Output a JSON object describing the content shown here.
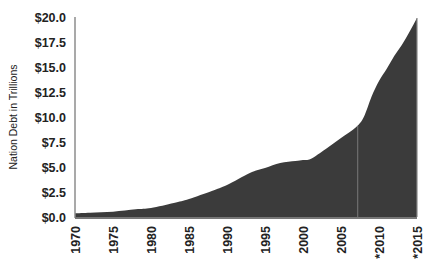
{
  "chart_data": {
    "type": "area",
    "title": "",
    "xlabel": "",
    "ylabel": "Nation Debt in Trillions",
    "x_tick_labels": [
      "1970",
      "1975",
      "1980",
      "1985",
      "1990",
      "1995",
      "2000",
      "2005",
      "*2010",
      "*2015"
    ],
    "y_tick_labels": [
      "$0.0",
      "$2.5",
      "$5.0",
      "$7.5",
      "$10.0",
      "$12.5",
      "$15.0",
      "$17.5",
      "$20.0"
    ],
    "xlim": [
      1970,
      2015
    ],
    "ylim": [
      0,
      20
    ],
    "grid": false,
    "legend": null,
    "fill_color": "#3b3b3b",
    "series": [
      {
        "name": "National Debt (Trillions USD)",
        "x": [
          1970,
          1972,
          1975,
          1978,
          1980,
          1983,
          1985,
          1988,
          1990,
          1993,
          1995,
          1997,
          1999,
          2000,
          2001,
          2003,
          2005,
          2007,
          2008,
          2009,
          2010,
          2011,
          2012,
          2013,
          2014,
          2015
        ],
        "values": [
          0.37,
          0.43,
          0.53,
          0.77,
          0.9,
          1.4,
          1.8,
          2.6,
          3.2,
          4.4,
          4.9,
          5.4,
          5.6,
          5.7,
          5.8,
          6.8,
          7.9,
          9.0,
          10.0,
          12.0,
          13.6,
          14.8,
          16.1,
          17.2,
          18.5,
          19.9
        ]
      }
    ],
    "annotations": [
      "Vertical divider line near 2007 separating actual from projected (*) values"
    ]
  }
}
